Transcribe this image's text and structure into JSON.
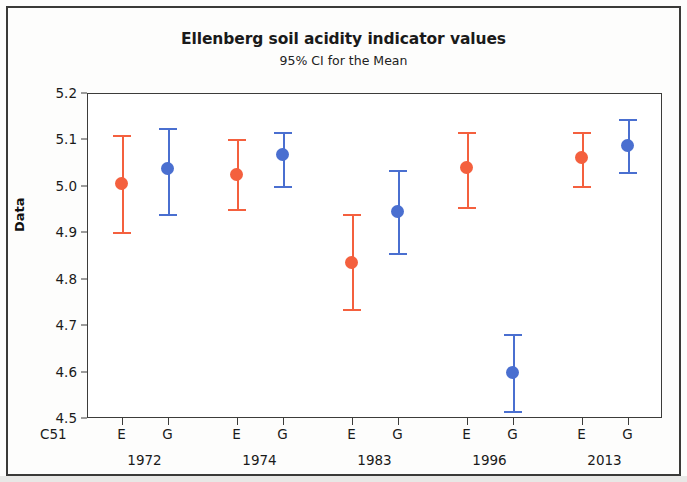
{
  "chart_data": {
    "type": "scatter",
    "title": "Ellenberg soil acidity indicator values",
    "subtitle": "95% CI for the Mean",
    "xlabel": "",
    "ylabel": "Data",
    "corner_label": "C51",
    "ylim": [
      4.5,
      5.2
    ],
    "yticks": [
      4.5,
      4.6,
      4.7,
      4.8,
      4.9,
      5.0,
      5.1,
      5.2
    ],
    "ytick_labels": [
      "4.5",
      "4.6",
      "4.7",
      "4.8",
      "4.9",
      "5.0",
      "5.1",
      "5.2"
    ],
    "grid": false,
    "legend": "none",
    "group_labels": [
      "E",
      "G"
    ],
    "categories": [
      "1972",
      "1974",
      "1983",
      "1996",
      "2013"
    ],
    "colors": {
      "E": "#F4603E",
      "G": "#4A6FD0",
      "axis": "#3c3c3a",
      "frame": "#3a3a38"
    },
    "series": [
      {
        "name": "E",
        "color": "#F4603E",
        "points": [
          {
            "category": "1972",
            "mean": 5.005,
            "ci_low": 4.9,
            "ci_high": 5.11
          },
          {
            "category": "1974",
            "mean": 5.025,
            "ci_low": 4.95,
            "ci_high": 5.1
          },
          {
            "category": "1983",
            "mean": 4.835,
            "ci_low": 4.735,
            "ci_high": 4.94
          },
          {
            "category": "1996",
            "mean": 5.04,
            "ci_low": 4.955,
            "ci_high": 5.115
          },
          {
            "category": "2013",
            "mean": 5.062,
            "ci_low": 5.0,
            "ci_high": 5.115
          }
        ]
      },
      {
        "name": "G",
        "color": "#4A6FD0",
        "points": [
          {
            "category": "1972",
            "mean": 5.038,
            "ci_low": 4.94,
            "ci_high": 5.125
          },
          {
            "category": "1974",
            "mean": 5.067,
            "ci_low": 5.0,
            "ci_high": 5.115
          },
          {
            "category": "1983",
            "mean": 4.945,
            "ci_low": 4.855,
            "ci_high": 5.035
          },
          {
            "category": "1996",
            "mean": 4.598,
            "ci_low": 4.515,
            "ci_high": 4.68
          },
          {
            "category": "2013",
            "mean": 5.088,
            "ci_low": 5.03,
            "ci_high": 5.145
          }
        ]
      }
    ]
  }
}
